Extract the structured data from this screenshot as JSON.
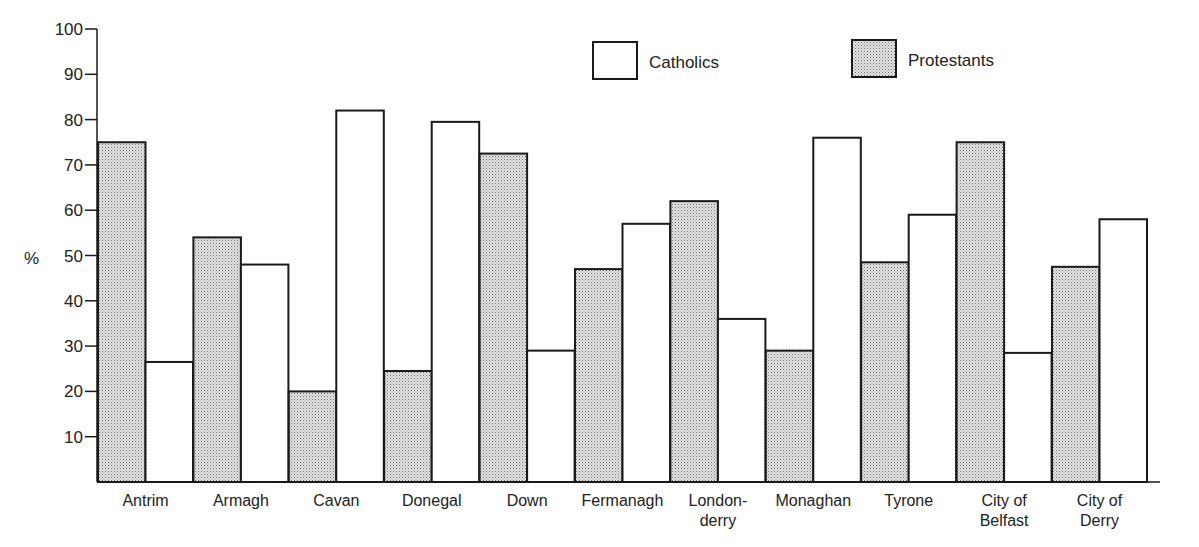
{
  "chart_data": {
    "type": "bar",
    "title": "",
    "xlabel": "",
    "ylabel": "%",
    "ylim": [
      0,
      100
    ],
    "yticks": [
      10,
      20,
      30,
      40,
      50,
      60,
      70,
      80,
      90,
      100
    ],
    "grid": false,
    "legend_position": "top-right",
    "categories": [
      [
        "Antrim"
      ],
      [
        "Armagh"
      ],
      [
        "Cavan"
      ],
      [
        "Donegal"
      ],
      [
        "Down"
      ],
      [
        "Fermanagh"
      ],
      [
        "London-",
        "derry"
      ],
      [
        "Monaghan"
      ],
      [
        "Tyrone"
      ],
      [
        "City of",
        "Belfast"
      ],
      [
        "City of",
        "Derry"
      ]
    ],
    "category_names": [
      "Antrim",
      "Armagh",
      "Cavan",
      "Donegal",
      "Down",
      "Fermanagh",
      "Londonderry",
      "Monaghan",
      "Tyrone",
      "City of Belfast",
      "City of Derry"
    ],
    "series": [
      {
        "name": "Protestants",
        "fill": "pattern-dots",
        "values": [
          75,
          54,
          20,
          24.5,
          72.5,
          47,
          62,
          29,
          48.5,
          75,
          47.5
        ]
      },
      {
        "name": "Catholics",
        "fill": "#ffffff",
        "values": [
          26.5,
          48,
          82,
          79.5,
          29,
          57,
          36,
          76,
          59,
          28.5,
          58
        ]
      }
    ]
  },
  "legend": [
    {
      "label": "Catholics",
      "fill": "#ffffff"
    },
    {
      "label": "Protestants",
      "fill": "pattern-dots"
    }
  ],
  "colors": {
    "ink": "#1a1a1a",
    "dot": "#6b6b6b",
    "paper": "#ffffff"
  }
}
